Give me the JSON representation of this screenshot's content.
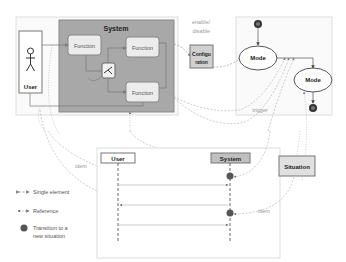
{
  "system": {
    "title": "System",
    "fill": "#a8a8a8"
  },
  "functions": [
    {
      "label": "Function"
    },
    {
      "label": "Function"
    },
    {
      "label": "Function"
    }
  ],
  "user_box": {
    "label": "User"
  },
  "configuration": {
    "line1": "Configu",
    "line2": "ration"
  },
  "enable_disable": {
    "line1": "enable/",
    "line2": "disable"
  },
  "modes": [
    {
      "label": "Mode"
    },
    {
      "label": "Mode"
    }
  ],
  "trigger": {
    "label": "trigger"
  },
  "sequence": {
    "user": "User",
    "system": "System"
  },
  "situation": {
    "label": "Situation"
  },
  "idem_labels": {
    "left": "idem",
    "right": "idem"
  },
  "legend": {
    "single_element": "Single element",
    "reference": "Reference",
    "transition_line1": "Transition to a",
    "transition_line2": "new situation"
  }
}
